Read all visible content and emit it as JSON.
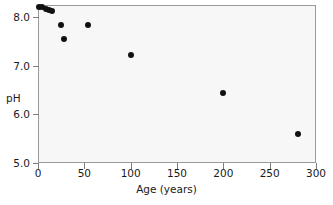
{
  "chart_data": {
    "type": "scatter",
    "title": "",
    "xlabel": "Age (years)",
    "ylabel": "pH",
    "xlim": [
      0,
      300
    ],
    "ylim": [
      5.0,
      8.25
    ],
    "xticks": [
      0,
      50,
      100,
      150,
      200,
      250,
      300
    ],
    "xtick_labels": [
      "0",
      "50",
      "100",
      "150",
      "200",
      "250",
      "300"
    ],
    "yticks": [
      5.0,
      6.0,
      7.0,
      8.0
    ],
    "ytick_labels": [
      "5.0",
      "6.0",
      "7.0",
      "8.0"
    ],
    "grid": false,
    "legend": null,
    "marker": "filled-circle",
    "marker_color": "#111111",
    "plot_background": "#f7f7f7",
    "frame_color": "#9a9a9a",
    "points": [
      {
        "x": 1,
        "y": 8.2
      },
      {
        "x": 4,
        "y": 8.21
      },
      {
        "x": 9,
        "y": 8.17
      },
      {
        "x": 12,
        "y": 8.14
      },
      {
        "x": 15,
        "y": 8.12
      },
      {
        "x": 25,
        "y": 7.83
      },
      {
        "x": 28,
        "y": 7.55
      },
      {
        "x": 54,
        "y": 7.83
      },
      {
        "x": 100,
        "y": 7.22
      },
      {
        "x": 200,
        "y": 6.45
      },
      {
        "x": 281,
        "y": 5.6
      }
    ]
  }
}
